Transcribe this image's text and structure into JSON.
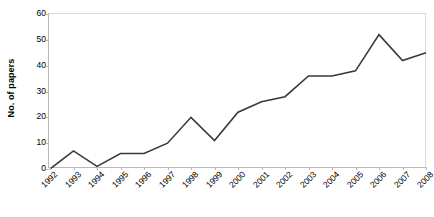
{
  "chart_data": {
    "type": "line",
    "title": "",
    "xlabel": "",
    "ylabel": "No. of papers",
    "categories": [
      "1992",
      "1993",
      "1994",
      "1995",
      "1996",
      "1997",
      "1998",
      "1999",
      "2000",
      "2001",
      "2002",
      "2003",
      "2004",
      "2005",
      "2006",
      "2007",
      "2008"
    ],
    "values": [
      0,
      7,
      1,
      6,
      6,
      10,
      20,
      11,
      22,
      26,
      28,
      36,
      36,
      38,
      52,
      42,
      45
    ],
    "series": [
      {
        "name": "No. of papers",
        "values": [
          0,
          7,
          1,
          6,
          6,
          10,
          20,
          11,
          22,
          26,
          28,
          36,
          36,
          38,
          52,
          42,
          45
        ]
      }
    ],
    "ylim": [
      0,
      60
    ],
    "y_ticks": [
      0,
      10,
      20,
      30,
      40,
      50,
      60
    ],
    "y_tick_labels": [
      "0",
      "10",
      "20",
      "30",
      "40",
      "50",
      "60"
    ],
    "grid": false,
    "legend": "none",
    "line_color": "#3a3a3a",
    "axis_color": "#b8b8b8",
    "frame_color": "#d9d9d9",
    "background_color": "#ffffff",
    "x_label_rotation": "-45"
  }
}
